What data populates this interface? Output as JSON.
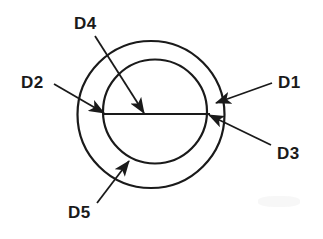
{
  "figure": {
    "background_color": "#ffffff",
    "line_color": "#1a1a1a",
    "label_color": "#1a1a1a"
  },
  "geometry": {
    "outer_circle": {
      "cx": 151,
      "cy": 114.5,
      "r": 73.5,
      "stroke_width": 2.2
    },
    "inner_circle": {
      "cx": 155,
      "cy": 111.5,
      "r": 52,
      "stroke_width": 2.2
    },
    "diameter_line": {
      "x1": 103,
      "y1": 114,
      "x2": 210,
      "y2": 114,
      "stroke_width": 2.0
    }
  },
  "callouts": [
    {
      "id": "D1",
      "label": "D1",
      "label_x": 278,
      "label_y": 74,
      "leader": {
        "x1": 272,
        "y1": 83,
        "x2": 216,
        "y2": 103
      },
      "arrow_at": "outer-circle-right",
      "meaning": "outer diameter"
    },
    {
      "id": "D2",
      "label": "D2",
      "label_x": 21,
      "label_y": 74,
      "leader": {
        "x1": 54,
        "y1": 84,
        "x2": 104,
        "y2": 113
      },
      "arrow_at": "inner-circle-left",
      "meaning": "inner diameter left reference"
    },
    {
      "id": "D3",
      "label": "D3",
      "label_x": 277,
      "label_y": 145,
      "leader": {
        "x1": 271,
        "y1": 145,
        "x2": 209,
        "y2": 115
      },
      "arrow_at": "inner-circle-right",
      "meaning": "inner diameter right reference"
    },
    {
      "id": "D4",
      "label": "D4",
      "label_x": 74,
      "label_y": 15,
      "leader": {
        "x1": 95,
        "y1": 36,
        "x2": 144,
        "y2": 113
      },
      "arrow_at": "diameter-line-midpoint",
      "meaning": "radius / centre reference"
    },
    {
      "id": "D5",
      "label": "D5",
      "label_x": 68,
      "label_y": 204,
      "leader": {
        "x1": 97,
        "y1": 203,
        "x2": 129,
        "y2": 161
      },
      "arrow_at": "inner-circle-bottom-left",
      "meaning": "wall thickness / bottom reference"
    }
  ]
}
